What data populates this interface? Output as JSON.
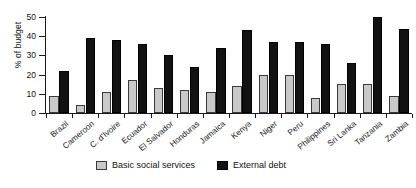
{
  "chart_data": {
    "type": "bar",
    "title": "",
    "xlabel": "",
    "ylabel": "% of budget",
    "ylim": [
      0,
      50
    ],
    "yticks": [
      0,
      10,
      20,
      30,
      40,
      50
    ],
    "grid": false,
    "legend_position": "bottom",
    "categories": [
      "Brazil",
      "Cameroon",
      "C. d'Ivoire",
      "Ecuador",
      "El Salvador",
      "Honduras",
      "Jamaica",
      "Kenya",
      "Niger",
      "Peru",
      "Philippines",
      "Sri Lanka",
      "Tanzania",
      "Zambia"
    ],
    "series": [
      {
        "name": "Basic social services",
        "color": "#c9c9c9",
        "values": [
          9,
          4,
          11,
          17,
          13,
          12,
          11,
          14,
          20,
          20,
          8,
          15,
          15,
          9
        ]
      },
      {
        "name": "External debt",
        "color": "#121212",
        "values": [
          22,
          39,
          38,
          36,
          30,
          24,
          34,
          43,
          37,
          37,
          36,
          26,
          50,
          44
        ]
      }
    ]
  },
  "legend": {
    "entries": [
      {
        "label": "Basic social services",
        "swatch": "social"
      },
      {
        "label": "External debt",
        "swatch": "debt"
      }
    ]
  }
}
